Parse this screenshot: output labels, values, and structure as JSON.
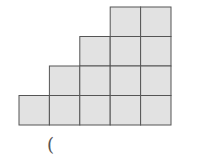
{
  "diagram": {
    "type": "staircase-grid",
    "cell_fill": "#e2e2e2",
    "line_color": "#555555",
    "rows": [
      {
        "row": 1,
        "start_col": 4,
        "count": 2
      },
      {
        "row": 2,
        "start_col": 3,
        "count": 3
      },
      {
        "row": 3,
        "start_col": 2,
        "count": 4
      },
      {
        "row": 4,
        "start_col": 1,
        "count": 5
      }
    ],
    "total_squares": 14,
    "origin_x": 19,
    "origin_y": 7,
    "cell_w": 30.4,
    "cell_h": 29.5
  },
  "answer_blank": "("
}
